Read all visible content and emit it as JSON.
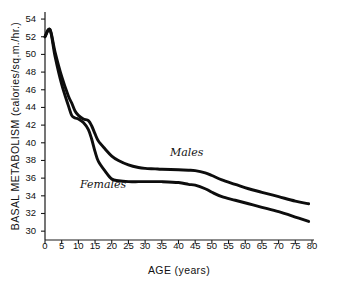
{
  "chart_data": {
    "type": "line",
    "title": "",
    "xlabel": "AGE (years)",
    "ylabel": "BASAL METABOLISM (calories/sq.m./hr.)",
    "xlim": [
      0,
      80
    ],
    "ylim": [
      29,
      54.8
    ],
    "xticks": [
      0,
      5,
      10,
      15,
      20,
      25,
      30,
      35,
      40,
      45,
      50,
      55,
      60,
      65,
      70,
      75,
      80
    ],
    "xtick_labels": [
      "0",
      "5",
      "10",
      "15",
      "20",
      "25",
      "30",
      "35",
      "40",
      "45",
      "50",
      "55",
      "60",
      "65",
      "70",
      "75",
      "80"
    ],
    "yticks": [
      30,
      32,
      34,
      36,
      38,
      40,
      42,
      44,
      46,
      48,
      50,
      52,
      54
    ],
    "ytick_labels": [
      "30",
      "32",
      "34",
      "36",
      "38",
      "40",
      "42",
      "44",
      "46",
      "48",
      "50",
      "52",
      "54"
    ],
    "grid": false,
    "legend_position": "inline-annotation",
    "series": [
      {
        "name": "Males",
        "color": "#0d0d0d",
        "x": [
          0,
          1.5,
          3,
          5,
          7,
          8,
          9,
          10,
          11.5,
          13,
          14,
          15,
          16,
          18,
          20,
          22,
          25,
          28,
          30,
          33,
          35,
          40,
          43,
          45,
          48,
          50,
          53,
          57,
          61,
          65,
          70,
          75,
          79
        ],
        "y": [
          52.0,
          52.8,
          50.3,
          47.5,
          45.3,
          44.5,
          43.6,
          43.1,
          42.7,
          42.5,
          41.9,
          41.0,
          40.2,
          39.3,
          38.5,
          38.0,
          37.5,
          37.2,
          37.1,
          37.05,
          37.0,
          36.95,
          36.9,
          36.85,
          36.6,
          36.3,
          35.8,
          35.3,
          34.8,
          34.4,
          33.9,
          33.4,
          33.1
        ]
      },
      {
        "name": "Females",
        "color": "#0d0d0d",
        "x": [
          0,
          1.5,
          3,
          5,
          7,
          8,
          9,
          10,
          11.5,
          13,
          14,
          15,
          16,
          18,
          20,
          22,
          25,
          28,
          30,
          33,
          35,
          40,
          43,
          45,
          48,
          50,
          53,
          57,
          61,
          65,
          70,
          75,
          79
        ],
        "y": [
          52.0,
          52.8,
          49.8,
          46.6,
          44.2,
          43.1,
          42.8,
          42.7,
          42.3,
          41.5,
          40.4,
          39.0,
          37.9,
          36.8,
          35.9,
          35.7,
          35.6,
          35.6,
          35.6,
          35.6,
          35.6,
          35.5,
          35.3,
          35.2,
          34.8,
          34.4,
          33.9,
          33.5,
          33.1,
          32.7,
          32.2,
          31.6,
          31.1
        ]
      }
    ],
    "annotations": [
      {
        "text": "Males",
        "x": 38,
        "y": 38.6
      },
      {
        "text": "Females",
        "x": 11,
        "y": 34.6
      }
    ]
  }
}
